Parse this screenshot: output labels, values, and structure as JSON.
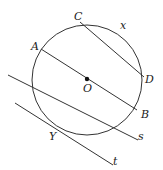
{
  "diagram": {
    "type": "geometry",
    "circle": {
      "cx": 87,
      "cy": 80,
      "r": 55,
      "center_label": "O"
    },
    "points": {
      "A": {
        "label": "A",
        "x": 41,
        "y": 49
      },
      "B": {
        "label": "B",
        "x": 137,
        "y": 110
      },
      "C": {
        "label": "C",
        "x": 78,
        "y": 25
      },
      "D": {
        "label": "D",
        "x": 141,
        "y": 76
      },
      "O": {
        "label": "O",
        "x": 87,
        "y": 79
      },
      "Y": {
        "label": "Y",
        "x": 55,
        "y": 128
      }
    },
    "arc_label": "x",
    "lines": {
      "s": {
        "label": "s"
      },
      "t": {
        "label": "t"
      }
    },
    "colors": {
      "stroke": "#333333",
      "background": "#ffffff"
    }
  }
}
